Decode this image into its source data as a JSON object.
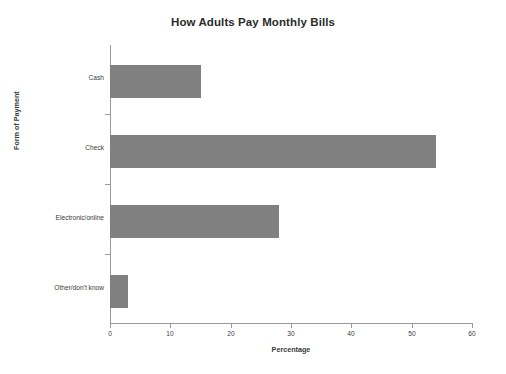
{
  "chart_data": {
    "type": "bar",
    "orientation": "horizontal",
    "title": "How Adults Pay Monthly Bills",
    "xlabel": "Percentage",
    "ylabel": "Form of Payment",
    "categories": [
      "Cash",
      "Check",
      "Electronic/online",
      "Other/don't know"
    ],
    "values": [
      15,
      54,
      28,
      3
    ],
    "xlim": [
      0,
      60
    ],
    "xticks": [
      "0",
      "10",
      "20",
      "30",
      "40",
      "50",
      "60"
    ],
    "xtick_values": [
      0,
      10,
      20,
      30,
      40,
      50,
      60
    ],
    "grid": false,
    "legend": null,
    "bar_color": "#808080",
    "axis_color": "#9a9a9a",
    "background_color": "#ffffff"
  }
}
